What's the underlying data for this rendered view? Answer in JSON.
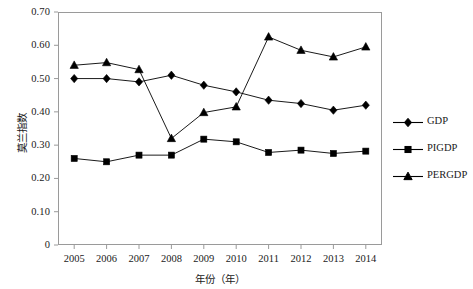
{
  "chart_data": {
    "type": "line",
    "title": "",
    "xlabel": "年份（年）",
    "ylabel": "莫兰指数",
    "categories": [
      "2005",
      "2006",
      "2007",
      "2008",
      "2009",
      "2010",
      "2011",
      "2012",
      "2013",
      "2014"
    ],
    "x": [
      2005,
      2006,
      2007,
      2008,
      2009,
      2010,
      2011,
      2012,
      2013,
      2014
    ],
    "xlim": [
      2004.5,
      2014.5
    ],
    "ylim": [
      0,
      0.7
    ],
    "ytick_labels": [
      "0.70",
      "0.60",
      "0.50",
      "0.40",
      "0.30",
      "0.20",
      "0.10",
      "0"
    ],
    "ytick_values": [
      0.7,
      0.6,
      0.5,
      0.4,
      0.3,
      0.2,
      0.1,
      0
    ],
    "grid": false,
    "legend_position": "right",
    "series": [
      {
        "name": "GDP",
        "marker": "diamond",
        "color": "#000000",
        "values": [
          0.5,
          0.5,
          0.49,
          0.51,
          0.48,
          0.46,
          0.435,
          0.425,
          0.405,
          0.42
        ]
      },
      {
        "name": "PIGDP",
        "marker": "square",
        "color": "#000000",
        "values": [
          0.26,
          0.25,
          0.27,
          0.27,
          0.318,
          0.31,
          0.278,
          0.285,
          0.275,
          0.282
        ]
      },
      {
        "name": "PERGDP",
        "marker": "triangle",
        "color": "#000000",
        "values": [
          0.54,
          0.548,
          0.527,
          0.32,
          0.398,
          0.415,
          0.625,
          0.585,
          0.565,
          0.595
        ]
      }
    ]
  },
  "legend": {
    "items": [
      {
        "label": "GDP",
        "marker": "diamond"
      },
      {
        "label": "PIGDP",
        "marker": "square"
      },
      {
        "label": "PERGDP",
        "marker": "triangle"
      }
    ]
  }
}
